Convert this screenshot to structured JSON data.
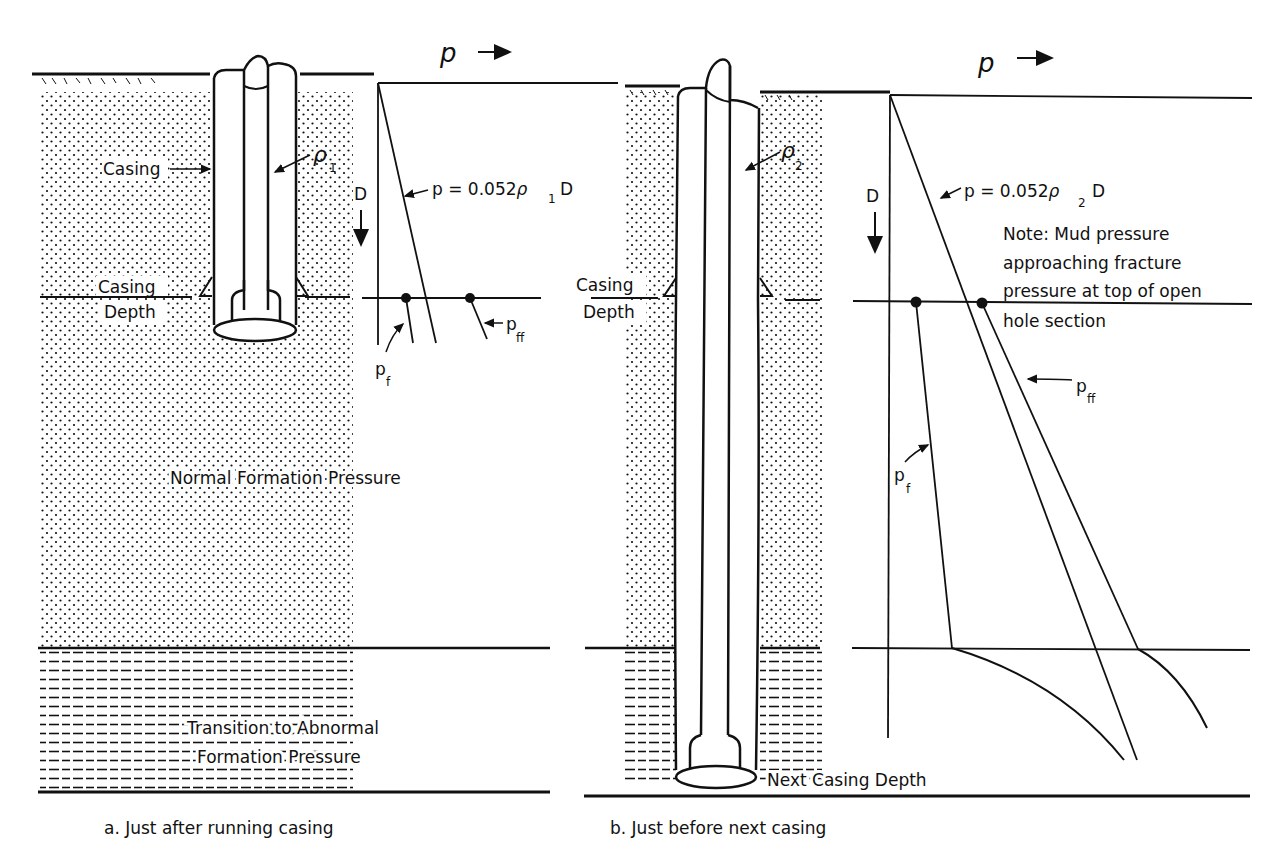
{
  "colors": {
    "ink": "#111111",
    "paper": "#ffffff"
  },
  "panel_a": {
    "caption": "a.  Just after running casing",
    "labels": {
      "casing": "Casing",
      "casing_depth_1": "Casing",
      "casing_depth_2": "Depth",
      "density": "ρ",
      "density_sub": "1",
      "normal_pressure": "Normal Formation Pressure",
      "transition_1": "Transition to Abnormal",
      "transition_2": "Formation Pressure"
    },
    "graph": {
      "p_axis": "p",
      "d_axis": "D",
      "equation_prefix": "p = 0.052",
      "equation_rho": "ρ",
      "equation_sub": "1",
      "equation_suffix": "D",
      "pf": "p",
      "pf_sub": "f",
      "pff": "p",
      "pff_sub": "ff"
    }
  },
  "panel_b": {
    "caption": "b.  Just before next casing",
    "labels": {
      "casing_depth_1": "Casing",
      "casing_depth_2": "Depth",
      "density": "ρ",
      "density_sub": "2",
      "next_casing_depth": "Next Casing Depth"
    },
    "graph": {
      "p_axis": "p",
      "d_axis": "D",
      "equation_prefix": "p = 0.052",
      "equation_rho": "ρ",
      "equation_sub": "2",
      "equation_suffix": "D",
      "note_1": "Note:  Mud pressure",
      "note_2": "approaching fracture",
      "note_3": "pressure at top of open",
      "note_4": "hole section",
      "pf": "p",
      "pf_sub": "f",
      "pff": "p",
      "pff_sub": "ff"
    }
  }
}
